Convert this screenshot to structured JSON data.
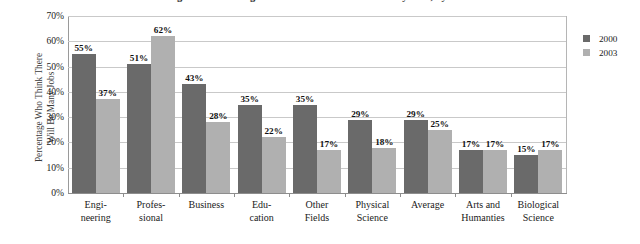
{
  "figure": {
    "caption_fragment": "Figure 1. Percentage Who Think There Will Be Many Jobs, by Field",
    "ylabel_line1": "Percentage Who Think There",
    "ylabel_line2": "Will Be Many Jobs"
  },
  "legend": {
    "position": "right",
    "entries": [
      {
        "label": "2000",
        "color": "#6a6a6a"
      },
      {
        "label": "2003",
        "color": "#b0b0b0"
      }
    ]
  },
  "chart_data": {
    "type": "bar",
    "title": "",
    "xlabel": "",
    "ylabel": "Percentage Who Think There Will Be Many Jobs",
    "ylim": [
      0,
      70
    ],
    "ytick_labels": [
      "0%",
      "10%",
      "20%",
      "30%",
      "40%",
      "50%",
      "60%",
      "70%"
    ],
    "ytick_values": [
      0,
      10,
      20,
      30,
      40,
      50,
      60,
      70
    ],
    "grid": true,
    "categories": [
      "Engineering",
      "Professional",
      "Business",
      "Education",
      "Other Fields",
      "Physical Science",
      "Average",
      "Arts and Humanities",
      "Biological Science"
    ],
    "category_lines": [
      [
        "Engi-",
        "neering"
      ],
      [
        "Profes-",
        "sional"
      ],
      [
        "Business",
        ""
      ],
      [
        "Edu-",
        "cation"
      ],
      [
        "Other",
        "Fields"
      ],
      [
        "Physical",
        "Science"
      ],
      [
        "Average",
        ""
      ],
      [
        "Arts and",
        "Humanties"
      ],
      [
        "Biological",
        "Science"
      ]
    ],
    "series": [
      {
        "name": "2000",
        "color": "#6a6a6a",
        "values": [
          55,
          51,
          43,
          35,
          35,
          29,
          29,
          17,
          15
        ],
        "labels": [
          "55%",
          "51%",
          "43%",
          "35%",
          "35%",
          "29%",
          "29%",
          "17%",
          "15%"
        ]
      },
      {
        "name": "2003",
        "color": "#b0b0b0",
        "values": [
          37,
          62,
          28,
          22,
          17,
          18,
          25,
          17,
          17
        ],
        "labels": [
          "37%",
          "62%",
          "28%",
          "22%",
          "17%",
          "18%",
          "25%",
          "17%",
          "17%"
        ]
      }
    ]
  }
}
